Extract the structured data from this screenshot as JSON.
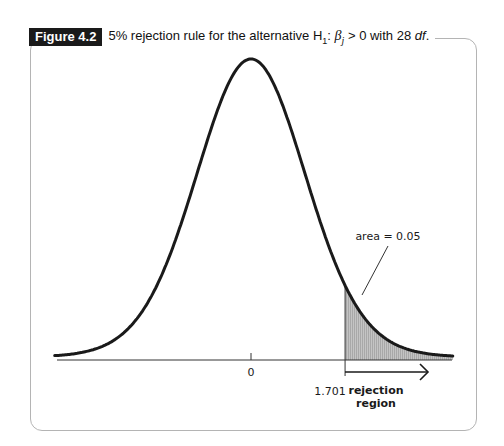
{
  "figure": {
    "label": "Figure 4.2",
    "caption_prefix": "5% rejection rule for the alternative H",
    "caption_sub": "1",
    "caption_sep": ": ",
    "caption_beta": "β",
    "caption_beta_sub": "j",
    "caption_rel": " > 0 with 28 ",
    "caption_df": "df",
    "caption_end": "."
  },
  "chart_data": {
    "type": "area",
    "title": "5% rejection rule for the alternative H1: βj > 0 with 28 df.",
    "distribution": "t",
    "degrees_of_freedom": 28,
    "xlim": [
      -3.55,
      3.65
    ],
    "x_ticks": [
      {
        "value": 0,
        "label": "0"
      },
      {
        "value": 1.701,
        "label": "1.701"
      }
    ],
    "critical_value": 1.701,
    "shaded_region": {
      "from": 1.701,
      "to": 3.65,
      "area": 0.05
    },
    "annotations": [
      {
        "text": "area = 0.05",
        "points_to": "shaded right tail"
      },
      {
        "text": "rejection region",
        "arrow_from": 1.701,
        "arrow_direction": "right"
      }
    ],
    "grid": false,
    "legend": null,
    "colors": {
      "curve": "#1a1a1a",
      "shade": "#bdbdbd",
      "axis": "#333333",
      "frame": "#b4b4b4"
    }
  },
  "labels": {
    "zero": "0",
    "critical": "1.701",
    "area": "area = 0.05",
    "rejection_line1": "rejection",
    "rejection_line2": "region"
  }
}
